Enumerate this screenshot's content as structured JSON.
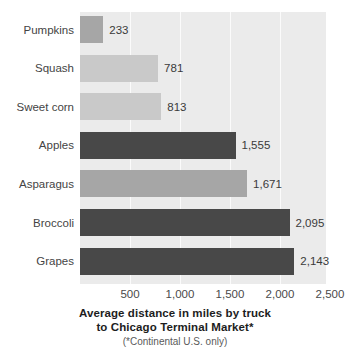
{
  "chart_data": {
    "type": "bar",
    "orientation": "horizontal",
    "title": "",
    "xlabel": "Average distance in miles by truck to Chicago Terminal Market*",
    "ylabel": "",
    "xlim": [
      0,
      2500
    ],
    "grid": true,
    "legend": null,
    "categories": [
      "Pumpkins",
      "Squash",
      "Sweet corn",
      "Apples",
      "Asparagus",
      "Broccoli",
      "Grapes"
    ],
    "values": [
      233,
      781,
      813,
      1555,
      1671,
      2095,
      2143
    ],
    "value_labels": [
      "233",
      "781",
      "813",
      "1,555",
      "1,671",
      "2,095",
      "2,143"
    ],
    "bar_shades": [
      "medium",
      "light",
      "light",
      "dark",
      "medium",
      "dark",
      "dark"
    ],
    "xticks": [
      500,
      1000,
      1500,
      2000,
      2500
    ],
    "xtick_labels": [
      "500",
      "1,000",
      "1,500",
      "2,000",
      "2,500"
    ]
  },
  "caption": {
    "line1": "Average distance in miles by truck",
    "line2": "to Chicago Terminal Market*",
    "note": "(*Continental U.S. only)"
  },
  "colors": {
    "dark": "#484848",
    "medium": "#a6a6a6",
    "light": "#c9c9c9",
    "plot_background": "#ebebeb",
    "gridline": "#fbfbfb",
    "page_background": "#ffffff",
    "text": "#3a3a3a"
  }
}
